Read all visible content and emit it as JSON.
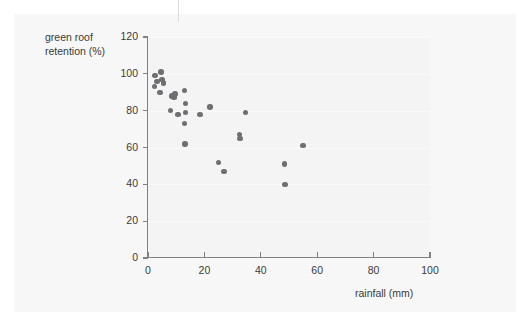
{
  "figure": {
    "background_color": "#f7f7f7",
    "plot_background_color": "#f4f4f4",
    "axis_color": "#808080",
    "point_color": "#6e6e73"
  },
  "chart_data": {
    "type": "scatter",
    "title": "",
    "xlabel": "rainfall (mm)",
    "ylabel": "green roof\nretention (%)",
    "xlim": [
      0,
      100
    ],
    "ylim": [
      0,
      120
    ],
    "xticks": [
      0,
      20,
      40,
      60,
      80,
      100
    ],
    "yticks": [
      0,
      20,
      40,
      60,
      80,
      100,
      120
    ],
    "xtick_labels": [
      "0",
      "20",
      "40",
      "60",
      "80",
      "100"
    ],
    "ytick_labels": [
      "0",
      "20",
      "40",
      "60",
      "80",
      "100",
      "120"
    ],
    "grid": "horizontal-faint",
    "legend": "none",
    "marker": "filled-circle",
    "n_points": 27,
    "points": [
      {
        "x": 2.5,
        "y": 99
      },
      {
        "x": 3.2,
        "y": 96
      },
      {
        "x": 2.2,
        "y": 93
      },
      {
        "x": 4.6,
        "y": 101
      },
      {
        "x": 5.0,
        "y": 97
      },
      {
        "x": 5.6,
        "y": 95
      },
      {
        "x": 4.2,
        "y": 90
      },
      {
        "x": 8.5,
        "y": 88
      },
      {
        "x": 9.2,
        "y": 87
      },
      {
        "x": 9.6,
        "y": 89
      },
      {
        "x": 8.0,
        "y": 80
      },
      {
        "x": 10.6,
        "y": 78
      },
      {
        "x": 13.0,
        "y": 91
      },
      {
        "x": 13.2,
        "y": 84
      },
      {
        "x": 13.4,
        "y": 79
      },
      {
        "x": 13.0,
        "y": 73
      },
      {
        "x": 13.1,
        "y": 62
      },
      {
        "x": 18.5,
        "y": 78
      },
      {
        "x": 22.0,
        "y": 82
      },
      {
        "x": 25.0,
        "y": 52
      },
      {
        "x": 27.0,
        "y": 47
      },
      {
        "x": 32.5,
        "y": 67
      },
      {
        "x": 32.6,
        "y": 65
      },
      {
        "x": 34.5,
        "y": 79
      },
      {
        "x": 48.5,
        "y": 51
      },
      {
        "x": 48.6,
        "y": 40
      },
      {
        "x": 55.0,
        "y": 61
      }
    ]
  }
}
